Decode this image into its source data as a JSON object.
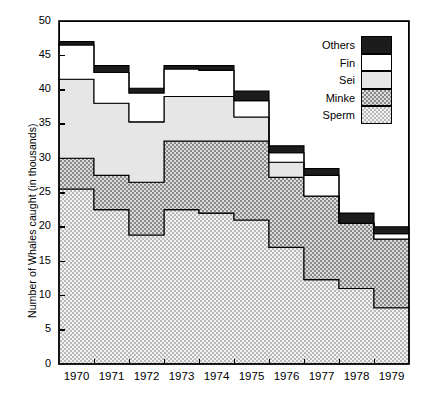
{
  "chart_data": {
    "type": "area",
    "subtype": "stacked-step-area",
    "title": "",
    "xlabel": "",
    "ylabel": "Number of Whales caught (in thousands)",
    "categories": [
      "1970",
      "1971",
      "1972",
      "1973",
      "1974",
      "1975",
      "1976",
      "1977",
      "1978",
      "1979"
    ],
    "xtick_labels": [
      "1970",
      "1971",
      "1972",
      "1973",
      "1974",
      "1975",
      "1976",
      "1977",
      "1978",
      "1979"
    ],
    "ytick_labels": [
      "0",
      "5",
      "10",
      "15",
      "20",
      "25",
      "30",
      "35",
      "40",
      "45",
      "50"
    ],
    "ytick_values": [
      0,
      5,
      10,
      15,
      20,
      25,
      30,
      35,
      40,
      45,
      50
    ],
    "ylim": [
      0,
      50
    ],
    "grid": false,
    "legend_position": "top-right",
    "legend_entries": [
      "Others",
      "Fin",
      "Sei",
      "Minke",
      "Sperm"
    ],
    "series": [
      {
        "name": "Sperm",
        "fill": "dotted",
        "color": "#e8e8e8",
        "values": [
          25.5,
          22.5,
          18.8,
          22.5,
          22.0,
          21.0,
          17.0,
          12.3,
          11.0,
          8.2
        ]
      },
      {
        "name": "Minke",
        "fill": "hatched",
        "color": "#a8a8a8",
        "values": [
          4.5,
          5.0,
          7.7,
          10.0,
          10.5,
          11.5,
          10.2,
          12.2,
          9.5,
          10.0
        ]
      },
      {
        "name": "Sei",
        "fill": "solid-light",
        "color": "#e0e0e0",
        "values": [
          11.5,
          10.5,
          8.8,
          6.5,
          6.5,
          3.5,
          2.2,
          0.0,
          0.0,
          0.0
        ]
      },
      {
        "name": "Fin",
        "fill": "white",
        "color": "#ffffff",
        "values": [
          5.0,
          4.5,
          4.2,
          4.0,
          3.8,
          2.4,
          1.4,
          3.0,
          0.0,
          0.8
        ]
      },
      {
        "name": "Others",
        "fill": "black",
        "color": "#1a1a1a",
        "values": [
          0.5,
          1.0,
          0.7,
          0.5,
          0.7,
          1.4,
          1.0,
          1.0,
          1.5,
          1.0
        ]
      }
    ],
    "totals": [
      47.0,
      43.5,
      39.7,
      43.0,
      43.5,
      40.0,
      31.8,
      28.5,
      22.0,
      20.0
    ],
    "cumulative_tops": {
      "Sperm": [
        25.5,
        22.5,
        18.8,
        22.5,
        22.0,
        21.0,
        17.0,
        12.3,
        11.0,
        8.2
      ],
      "Minke": [
        30.0,
        27.5,
        26.5,
        32.5,
        32.5,
        32.5,
        27.2,
        24.5,
        20.5,
        18.2
      ],
      "Sei": [
        41.5,
        38.0,
        35.3,
        39.0,
        39.0,
        36.0,
        29.4,
        24.5,
        20.5,
        18.2
      ],
      "Fin": [
        46.5,
        42.5,
        39.5,
        43.0,
        42.8,
        38.4,
        30.8,
        27.5,
        20.5,
        19.0
      ],
      "Others": [
        47.0,
        43.5,
        40.2,
        43.5,
        43.5,
        39.8,
        31.8,
        28.5,
        22.0,
        20.0
      ]
    }
  },
  "axis": {
    "y_axis_label": "Number of Whales caught (in thousands)"
  },
  "legend": {
    "items": [
      {
        "label": "Others",
        "swatch": "black"
      },
      {
        "label": "Fin",
        "swatch": "white"
      },
      {
        "label": "Sei",
        "swatch": "light-gray"
      },
      {
        "label": "Minke",
        "swatch": "hatched"
      },
      {
        "label": "Sperm",
        "swatch": "dotted"
      }
    ]
  }
}
